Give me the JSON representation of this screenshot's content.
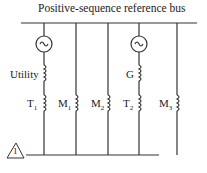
{
  "title": "Positive-sequence reference bus",
  "labels": {
    "utility": "Utility",
    "g": "G",
    "t1": "T",
    "t1_sub": "1",
    "m1": "M",
    "m1_sub": "1",
    "m2": "M",
    "m2_sub": "2",
    "t2": "T",
    "t2_sub": "2",
    "m3": "M",
    "m3_sub": "3",
    "bus_marker": "1"
  }
}
